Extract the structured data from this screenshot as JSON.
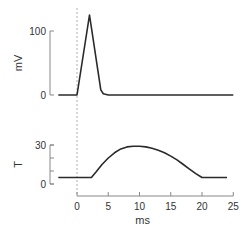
{
  "chart_data": [
    {
      "type": "line",
      "panel": "top",
      "title": "",
      "xlabel": "",
      "ylabel": "mV",
      "xlim": [
        -3,
        25
      ],
      "ylim": [
        0,
        100
      ],
      "yticks": [
        0,
        100
      ],
      "ytick_labels": [
        "0",
        "100"
      ],
      "grid": false,
      "series": [
        {
          "name": "membrane potential",
          "color": "#2a2a2a",
          "x": [
            -3,
            0,
            2,
            3.8,
            4.2,
            5,
            25
          ],
          "y": [
            0,
            0,
            125,
            8,
            2,
            0,
            0
          ]
        }
      ]
    },
    {
      "type": "line",
      "panel": "bottom",
      "title": "",
      "xlabel": "ms",
      "ylabel": "T",
      "xlim": [
        -3,
        25
      ],
      "ylim": [
        0,
        30
      ],
      "yticks": [
        0,
        10,
        20,
        30
      ],
      "ytick_labels": [
        "0",
        "",
        "",
        "30"
      ],
      "xticks": [
        0,
        5,
        10,
        15,
        20,
        25
      ],
      "xtick_labels": [
        "0",
        "5",
        "10",
        "15",
        "20",
        "25"
      ],
      "grid": false,
      "series": [
        {
          "name": "tension",
          "color": "#2a2a2a",
          "x": [
            -3,
            2.3,
            3,
            4,
            5,
            6,
            7,
            8,
            9,
            10,
            11,
            12,
            13,
            14,
            15,
            16,
            17,
            18,
            19,
            20,
            24
          ],
          "y": [
            5,
            5,
            9,
            15,
            20,
            24,
            27,
            28.5,
            29,
            29,
            28.5,
            27.5,
            26,
            24,
            21.5,
            18.5,
            15,
            11.5,
            8,
            5,
            5
          ]
        }
      ]
    }
  ],
  "annotations": {
    "stimulus_marker_x": 0
  }
}
